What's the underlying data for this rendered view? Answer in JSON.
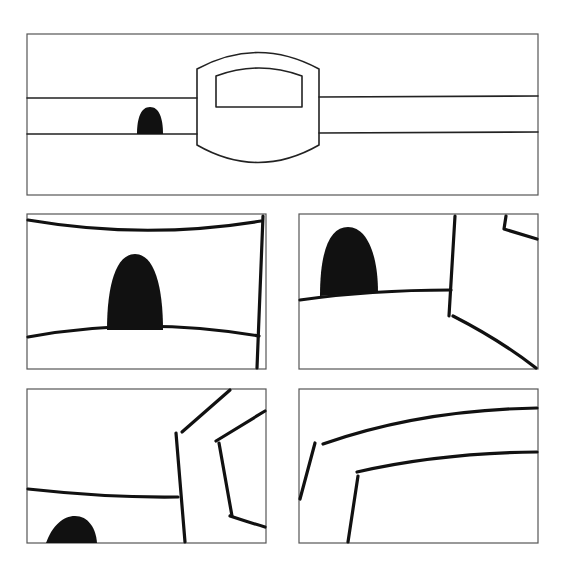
{
  "diagram": {
    "type": "comic-style line-art panels",
    "background": "#ffffff",
    "line_color": "#111111",
    "frame_color": "#555555",
    "panels": [
      {
        "id": "panel-top",
        "description": "Wide view: two horizontal rails passing through a rounded central machine with a window; small black dome shape on lower rail"
      },
      {
        "id": "panel-mid-left",
        "description": "Close-up of the black dome between curved rails; vertical edge at right"
      },
      {
        "id": "panel-mid-right",
        "description": "Dome at left on curved ground; corner of the central machine at right"
      },
      {
        "id": "panel-bottom-left",
        "description": "Dome partially visible at bottom left; angled frame of the machine at right"
      },
      {
        "id": "panel-bottom-right",
        "description": "Close-up of curved top edges of the machine window frame"
      }
    ]
  }
}
